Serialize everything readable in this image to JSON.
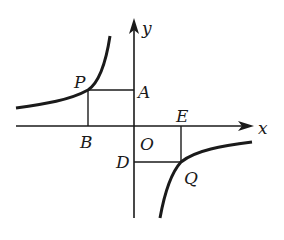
{
  "figure": {
    "axes": {
      "x_label": "x",
      "y_label": "y",
      "origin_label": "O"
    },
    "points": {
      "P": {
        "label": "P",
        "branch": "upper-left"
      },
      "Q": {
        "label": "Q",
        "branch": "lower-right"
      },
      "A": {
        "label": "A",
        "on": "y-axis",
        "foot_of": "P"
      },
      "B": {
        "label": "B",
        "on": "x-axis",
        "foot_of": "P"
      },
      "D": {
        "label": "D",
        "on": "y-axis",
        "foot_of": "Q"
      },
      "E": {
        "label": "E",
        "on": "x-axis",
        "foot_of": "Q"
      }
    },
    "colors": {
      "stroke": "#1a1a1a",
      "background": "#ffffff"
    }
  }
}
